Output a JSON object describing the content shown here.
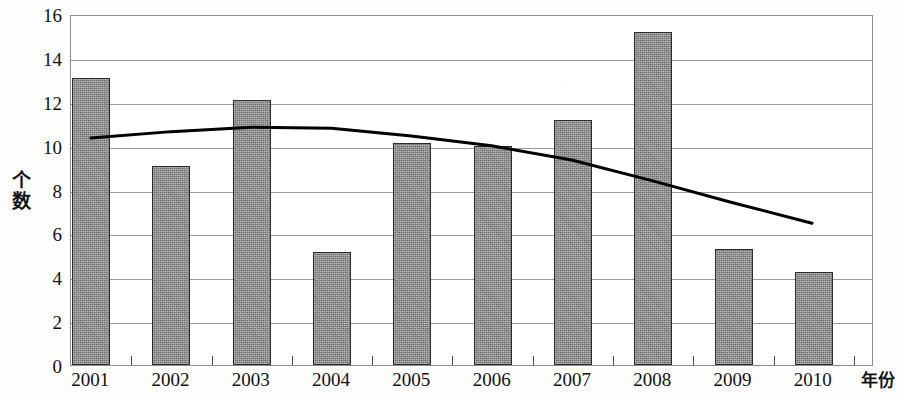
{
  "chart_data": {
    "type": "bar",
    "title": "",
    "subtitle": "",
    "xlabel": "年份",
    "ylabel": "个数",
    "categories": [
      "2001",
      "2002",
      "2003",
      "2004",
      "2005",
      "2006",
      "2007",
      "2008",
      "2009",
      "2010"
    ],
    "values": [
      13.1,
      9.05,
      12.1,
      5.15,
      10.1,
      10.0,
      11.15,
      15.2,
      5.3,
      4.25
    ],
    "series": [
      {
        "name": "个数",
        "type": "bar",
        "values": [
          13.1,
          9.05,
          12.1,
          5.15,
          10.1,
          10.0,
          11.15,
          15.2,
          5.3,
          4.25
        ]
      },
      {
        "name": "趋势线",
        "type": "line",
        "values": [
          10.4,
          10.7,
          10.9,
          10.85,
          10.5,
          10.05,
          9.4,
          8.45,
          7.45,
          6.5
        ]
      }
    ],
    "ylim": [
      0,
      16
    ],
    "xlim_categories": 10,
    "y_ticks": [
      "16",
      "14",
      "12",
      "10",
      "8",
      "6",
      "4",
      "2",
      "0"
    ],
    "y_tick_values": [
      16,
      14,
      12,
      10,
      8,
      6,
      4,
      2,
      0
    ],
    "y_tick_step": 2,
    "grid": true,
    "grid_axis": "y",
    "legend": false,
    "legend_position": "none",
    "bar_color": "#787878",
    "bar_border_color": "#2c2c2c",
    "line_color": "#000000",
    "gridline_color": "#9a9a9a",
    "axis_color": "#8d8d8d",
    "background": "#ffffff"
  }
}
